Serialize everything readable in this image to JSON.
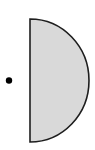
{
  "diagram": {
    "shapes": [
      {
        "kind": "half-disc",
        "orientation": "flat-edge-left",
        "center": [
          30,
          80.5
        ],
        "rx": 59,
        "ry": 61.5,
        "fill": "#d9d9d9",
        "stroke": "#1e1e1e",
        "stroke_width": 1.6
      },
      {
        "kind": "point",
        "center": [
          9,
          80.5
        ],
        "r": 3.2,
        "fill": "#000000"
      }
    ]
  }
}
